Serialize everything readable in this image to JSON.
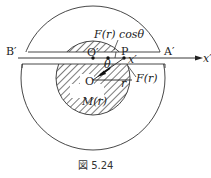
{
  "figure": {
    "caption": "図 5.24",
    "labels": {
      "B_prime": "B′",
      "A_prime": "A′",
      "O_prime": "O′",
      "P": "P",
      "x_prime_point": "x′",
      "x_prime_axis": "x′",
      "O": "O",
      "theta": "θ",
      "r": "r",
      "F_r": "F(r)",
      "F_r_cos_theta": "F(r) cosθ",
      "M_r": "M(r)"
    },
    "colors": {
      "line": "#222222",
      "hatch": "#333333",
      "background": "#ffffff"
    }
  }
}
